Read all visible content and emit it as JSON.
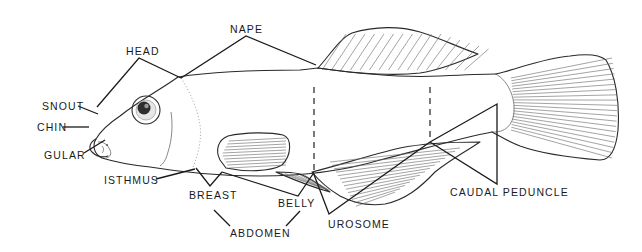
{
  "diagram": {
    "labels": {
      "head": "HEAD",
      "nape": "NAPE",
      "snout": "SNOUT",
      "chin": "CHIN",
      "gular": "GULAR",
      "isthmus": "ISTHMUS",
      "breast": "BREAST",
      "belly": "BELLY",
      "abdomen": "ABDOMEN",
      "urosome": "UROSOME",
      "caudal_peduncle": "CAUDAL PEDUNCLE"
    },
    "colors": {
      "line": "#1a1a1a",
      "background": "#ffffff"
    }
  }
}
